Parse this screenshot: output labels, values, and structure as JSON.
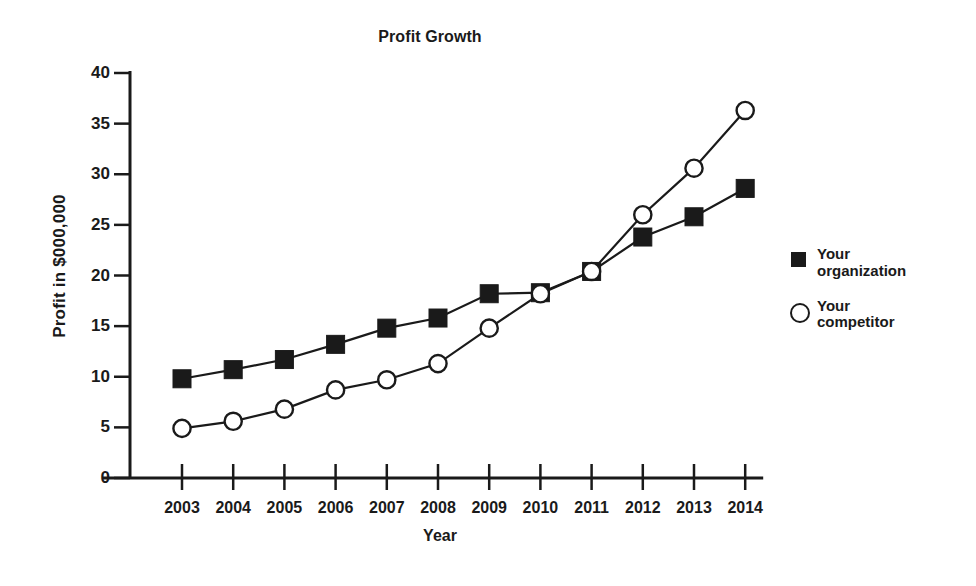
{
  "chart_data": {
    "type": "line",
    "title": "Profit Growth",
    "xlabel": "Year",
    "ylabel": "Profit in $000,000",
    "categories": [
      "2003",
      "2004",
      "2005",
      "2006",
      "2007",
      "2008",
      "2009",
      "2010",
      "2011",
      "2012",
      "2013",
      "2014"
    ],
    "xtick_labels": [
      "2003",
      "2004",
      "2005",
      "2006",
      "2007",
      "2008",
      "2009",
      "2010",
      "2011",
      "2012",
      "2013",
      "2014"
    ],
    "ytick_labels": [
      "0",
      "5",
      "10",
      "15",
      "20",
      "25",
      "30",
      "35",
      "40"
    ],
    "yticks": [
      0,
      5,
      10,
      15,
      20,
      25,
      30,
      35,
      40
    ],
    "ylim": [
      0,
      40
    ],
    "grid": false,
    "legend_position": "right",
    "series": [
      {
        "name": "Your organization",
        "marker": "filled-square",
        "color": "#1a1a1a",
        "values": [
          9.8,
          10.7,
          11.7,
          13.2,
          14.8,
          15.8,
          18.2,
          18.3,
          20.4,
          23.8,
          25.8,
          28.6
        ]
      },
      {
        "name": "Your competitor",
        "marker": "open-circle",
        "color": "#1a1a1a",
        "values": [
          4.9,
          5.6,
          6.8,
          8.7,
          9.7,
          11.3,
          14.8,
          18.2,
          20.4,
          26.0,
          30.6,
          36.3
        ]
      }
    ]
  },
  "legend": {
    "items": [
      {
        "label_line1": "Your",
        "label_line2": "organization"
      },
      {
        "label_line1": "Your",
        "label_line2": "competitor"
      }
    ]
  },
  "colors": {
    "ink": "#1a1a1a",
    "background": "#ffffff"
  }
}
